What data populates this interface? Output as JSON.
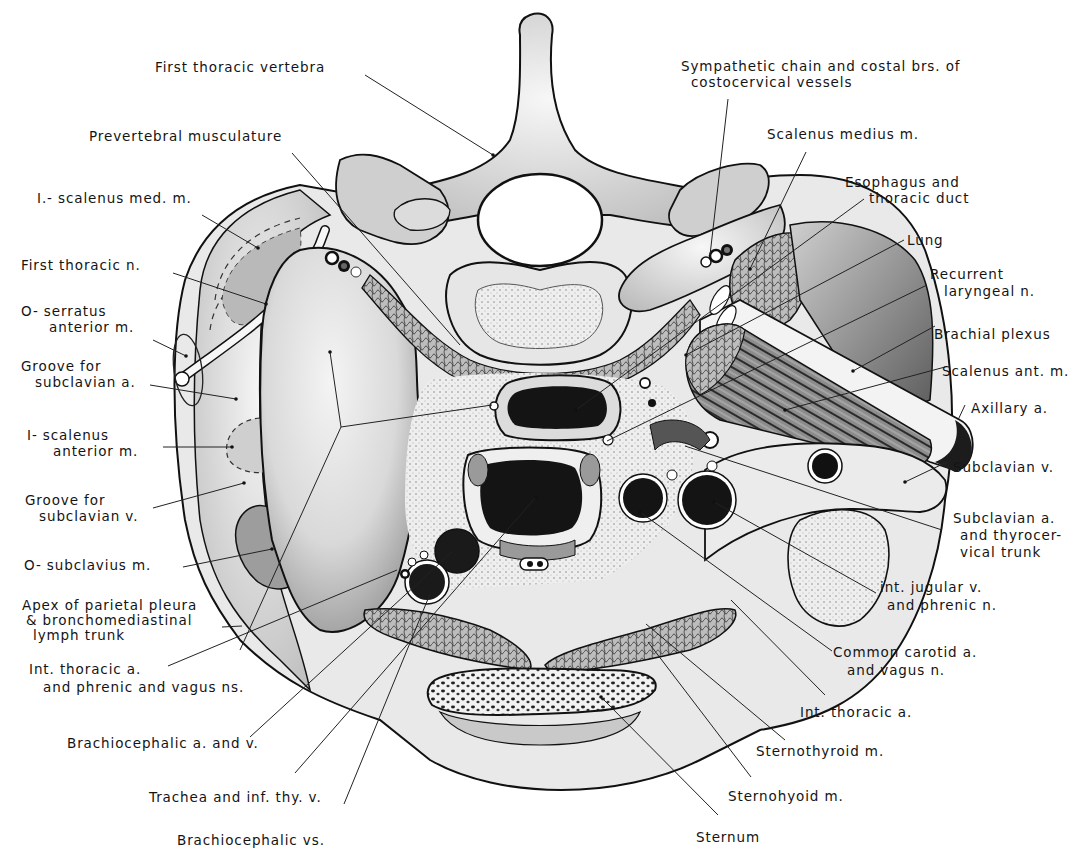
{
  "figure": {
    "colors": {
      "ink": "#141414",
      "bone": "#e8e8e8",
      "dark": "#1a1a1a",
      "mid": "#9a9a9a",
      "light": "#d4d4d4",
      "background": "#ffffff"
    }
  },
  "labels": {
    "first_thoracic_vertebra": "First thoracic vertebra",
    "prevertebral_musculature": "Prevertebral musculature",
    "scalenus_med_insertion": "I.- scalenus med. m.",
    "first_thoracic_n": "First thoracic n.",
    "serratus_anterior_origin": [
      "O- serratus",
      "anterior m."
    ],
    "groove_subclavian_a": [
      "Groove for",
      "subclavian a."
    ],
    "scalenus_anterior_insertion": [
      "I- scalenus",
      "anterior m."
    ],
    "groove_subclavian_v": [
      "Groove for",
      "subclavian v."
    ],
    "subclavius_origin": "O- subclavius m.",
    "apex_parietal_pleura": [
      "Apex of parietal pleura",
      "& bronchomediastinal",
      "lymph trunk"
    ],
    "int_thoracic_a_left": [
      "Int. thoracic a.",
      "and phrenic and vagus ns."
    ],
    "brachiocephalic_a_v": "Brachiocephalic a. and v.",
    "trachea": "Trachea and inf. thy. v.",
    "brachiocephalic_vs": "Brachiocephalic vs.",
    "sympathetic_chain": [
      "Sympathetic chain and costal brs. of",
      "costocervical vessels"
    ],
    "scalenus_medius": "Scalenus medius m.",
    "esophagus": [
      "Esophagus and",
      "thoracic duct"
    ],
    "lung": "Lung",
    "recurrent_laryngeal": [
      "Recurrent",
      "laryngeal n."
    ],
    "brachial_plexus": "Brachial plexus",
    "scalenus_ant": "Scalenus ant. m.",
    "axillary_a": "Axillary a.",
    "subclavian_v": "Subclavian v.",
    "subclavian_a": [
      "Subclavian a.",
      "and thyrocer-",
      "vical trunk"
    ],
    "int_jugular": [
      "int. jugular v.",
      "and phrenic n."
    ],
    "common_carotid": [
      "Common carotid a.",
      "and vagus n."
    ],
    "int_thoracic_a_right": "Int. thoracic a.",
    "sternothyroid": "Sternothyroid m.",
    "sternohyoid": "Sternohyoid m.",
    "sternum": "Sternum"
  }
}
